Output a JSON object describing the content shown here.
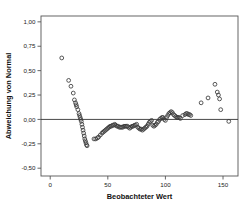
{
  "chart_data": {
    "type": "scatter",
    "title": "",
    "xlabel": "Beobachteter Wert",
    "ylabel": "Abweichung von Normal",
    "xlim": [
      -8,
      163
    ],
    "ylim": [
      -0.58,
      1.06
    ],
    "grid": false,
    "legend": null,
    "x_ticks": [
      0,
      50,
      100,
      150
    ],
    "x_tick_labels": [
      "0",
      "50",
      "100",
      "150"
    ],
    "y_ticks": [
      1.0,
      0.75,
      0.5,
      0.25,
      0.0,
      -0.25,
      -0.5
    ],
    "y_tick_labels": [
      "1,00",
      "0,75",
      "0,50",
      "0,25",
      "0,00",
      "-0,25",
      "-0,50"
    ],
    "reference_line_y": 0.0,
    "marker": "open-circle",
    "marker_color": "#3a3a3a",
    "points": [
      [
        10,
        0.63
      ],
      [
        16,
        0.4
      ],
      [
        18,
        0.34
      ],
      [
        20,
        0.27
      ],
      [
        21,
        0.2
      ],
      [
        22,
        0.17
      ],
      [
        22.5,
        0.15
      ],
      [
        23,
        0.13
      ],
      [
        24,
        0.1
      ],
      [
        25,
        0.06
      ],
      [
        25.5,
        0.04
      ],
      [
        26,
        0.02
      ],
      [
        26.5,
        0.0
      ],
      [
        27,
        -0.02
      ],
      [
        27.5,
        -0.05
      ],
      [
        28,
        -0.08
      ],
      [
        28.5,
        -0.11
      ],
      [
        29,
        -0.14
      ],
      [
        29.5,
        -0.17
      ],
      [
        30,
        -0.2
      ],
      [
        30.5,
        -0.22
      ],
      [
        31,
        -0.24
      ],
      [
        31.5,
        -0.26
      ],
      [
        32,
        -0.27
      ],
      [
        38,
        -0.2
      ],
      [
        39.5,
        -0.2
      ],
      [
        41,
        -0.19
      ],
      [
        42,
        -0.18
      ],
      [
        43.5,
        -0.16
      ],
      [
        45,
        -0.14
      ],
      [
        46,
        -0.13
      ],
      [
        47,
        -0.12
      ],
      [
        48,
        -0.11
      ],
      [
        49,
        -0.1
      ],
      [
        50,
        -0.09
      ],
      [
        51,
        -0.08
      ],
      [
        52,
        -0.07
      ],
      [
        53,
        -0.07
      ],
      [
        54,
        -0.06
      ],
      [
        55,
        -0.06
      ],
      [
        56,
        -0.05
      ],
      [
        57,
        -0.06
      ],
      [
        58,
        -0.07
      ],
      [
        59,
        -0.07
      ],
      [
        60,
        -0.08
      ],
      [
        61,
        -0.08
      ],
      [
        62,
        -0.08
      ],
      [
        63,
        -0.08
      ],
      [
        64,
        -0.07
      ],
      [
        65,
        -0.07
      ],
      [
        66,
        -0.07
      ],
      [
        67,
        -0.07
      ],
      [
        68,
        -0.08
      ],
      [
        69,
        -0.09
      ],
      [
        70,
        -0.08
      ],
      [
        71,
        -0.07
      ],
      [
        72,
        -0.07
      ],
      [
        73,
        -0.06
      ],
      [
        74,
        -0.06
      ],
      [
        75,
        -0.05
      ],
      [
        76,
        -0.08
      ],
      [
        77,
        -0.09
      ],
      [
        78,
        -0.1
      ],
      [
        79,
        -0.1
      ],
      [
        80,
        -0.11
      ],
      [
        81,
        -0.1
      ],
      [
        82,
        -0.09
      ],
      [
        83,
        -0.08
      ],
      [
        84,
        -0.07
      ],
      [
        85,
        -0.05
      ],
      [
        86,
        -0.03
      ],
      [
        87,
        -0.02
      ],
      [
        88,
        -0.01
      ],
      [
        89,
        -0.06
      ],
      [
        90,
        -0.07
      ],
      [
        91,
        -0.06
      ],
      [
        92,
        -0.05
      ],
      [
        93,
        -0.03
      ],
      [
        94,
        -0.02
      ],
      [
        95,
        0.0
      ],
      [
        96,
        0.01
      ],
      [
        97,
        0.02
      ],
      [
        98,
        0.02
      ],
      [
        99,
        0.0
      ],
      [
        100,
        -0.01
      ],
      [
        101,
        0.02
      ],
      [
        102,
        0.04
      ],
      [
        103,
        0.06
      ],
      [
        104,
        0.07
      ],
      [
        105,
        0.08
      ],
      [
        106,
        0.07
      ],
      [
        107,
        0.05
      ],
      [
        108,
        0.04
      ],
      [
        109,
        0.03
      ],
      [
        110,
        0.02
      ],
      [
        111,
        0.02
      ],
      [
        112,
        0.02
      ],
      [
        113,
        0.01
      ],
      [
        115,
        0.04
      ],
      [
        117,
        0.05
      ],
      [
        118,
        0.06
      ],
      [
        119,
        0.06
      ],
      [
        120,
        0.05
      ],
      [
        121,
        0.05
      ],
      [
        122,
        0.04
      ],
      [
        131,
        0.17
      ],
      [
        137,
        0.22
      ],
      [
        143,
        0.36
      ],
      [
        145,
        0.28
      ],
      [
        146,
        0.25
      ],
      [
        147,
        0.21
      ],
      [
        148,
        0.1
      ],
      [
        155,
        -0.02
      ]
    ]
  }
}
